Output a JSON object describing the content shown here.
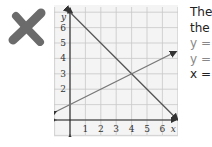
{
  "mark": {
    "icon": "x-mark-icon",
    "color": "#6b6b6b"
  },
  "note": {
    "line1": "The",
    "line2": "the",
    "line3": "y =",
    "line4": "y =",
    "line5": "x ="
  },
  "chart_data": {
    "type": "line",
    "title": "",
    "xlabel": "x",
    "ylabel": "y",
    "x_ticks": [
      "1",
      "2",
      "3",
      "4",
      "5",
      "6"
    ],
    "y_ticks": [
      "2",
      "3",
      "4",
      "5",
      "6"
    ],
    "xlim": [
      -0.9,
      7
    ],
    "ylim": [
      -1,
      7.3
    ],
    "grid": true,
    "series": [
      {
        "name": "y = -x + 7",
        "points": [
          [
            0,
            7
          ],
          [
            7,
            0
          ]
        ],
        "color": "#555555"
      },
      {
        "name": "y = 0.5x + 1",
        "points": [
          [
            -0.9,
            0.55
          ],
          [
            6.9,
            4.45
          ]
        ],
        "color": "#777777"
      }
    ],
    "intersection": [
      4,
      3
    ]
  }
}
